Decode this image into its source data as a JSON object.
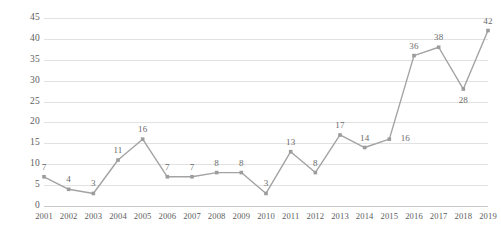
{
  "chart_data": {
    "type": "line",
    "title": "",
    "subtitle": "",
    "xlabel": "",
    "ylabel": "",
    "categories": [
      "2001",
      "2002",
      "2003",
      "2004",
      "2005",
      "2006",
      "2007",
      "2008",
      "2009",
      "2010",
      "2011",
      "2012",
      "2013",
      "2014",
      "2015",
      "2016",
      "2017",
      "2018",
      "2019"
    ],
    "values": [
      7,
      4,
      3,
      11,
      16,
      7,
      7,
      8,
      8,
      3,
      13,
      8,
      17,
      14,
      16,
      36,
      38,
      28,
      42
    ],
    "series": [
      {
        "name": "",
        "values": [
          7,
          4,
          3,
          11,
          16,
          7,
          7,
          8,
          8,
          3,
          13,
          8,
          17,
          14,
          16,
          36,
          38,
          28,
          42
        ]
      }
    ],
    "data_labels": [
      "7",
      "4",
      "3",
      "11",
      "16",
      "7",
      "7",
      "8",
      "8",
      "3",
      "13",
      "8",
      "17",
      "14",
      "16",
      "36",
      "38",
      "28",
      "42"
    ],
    "data_label_position": [
      "above",
      "above",
      "above",
      "above",
      "above",
      "above",
      "above",
      "above",
      "above",
      "above",
      "above",
      "above",
      "above",
      "above",
      "right",
      "above",
      "above",
      "below",
      "above"
    ],
    "ylim": [
      0,
      45
    ],
    "ytick_values": [
      0,
      5,
      10,
      15,
      20,
      25,
      30,
      35,
      40,
      45
    ],
    "ytick_labels": [
      "0",
      "5",
      "10",
      "15",
      "20",
      "25",
      "30",
      "35",
      "40",
      "45"
    ],
    "xtick_labels": [
      "2001",
      "2002",
      "2003",
      "2004",
      "2005",
      "2006",
      "2007",
      "2008",
      "2009",
      "2010",
      "2011",
      "2012",
      "2013",
      "2014",
      "2015",
      "2016",
      "2017",
      "2018",
      "2019"
    ],
    "grid": true,
    "grid_axis": "y",
    "legend": false,
    "legend_position": "none",
    "marker": "square",
    "colors": {
      "line": "#a3a3a3",
      "marker": "#9c9c9c",
      "gridline": "#e2e2e2",
      "axis": "#c8c8c8",
      "tick_label": "#5d5d5d",
      "data_label": "#6a6a6a",
      "background": "#ffffff"
    }
  }
}
